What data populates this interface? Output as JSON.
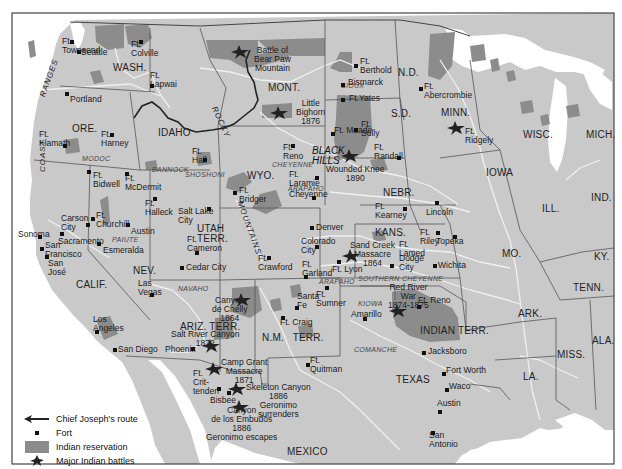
{
  "map": {
    "colors": {
      "land": "#c9c9c9",
      "reservation": "#8c8c8c",
      "water": "#ffffff",
      "border": "#555555",
      "river": "#efefef",
      "route": "#222222",
      "frame": "#444444"
    },
    "states": [
      {
        "id": "wash",
        "label": "WASH.",
        "x": 113,
        "y": 63
      },
      {
        "id": "ore",
        "label": "ORE.",
        "x": 72,
        "y": 124
      },
      {
        "id": "idaho",
        "label": "IDAHO",
        "x": 158,
        "y": 128
      },
      {
        "id": "mont",
        "label": "MONT.",
        "x": 268,
        "y": 83
      },
      {
        "id": "nd",
        "label": "N.D.",
        "x": 398,
        "y": 68
      },
      {
        "id": "sd",
        "label": "S.D.",
        "x": 391,
        "y": 109
      },
      {
        "id": "minn",
        "label": "MINN.",
        "x": 441,
        "y": 108
      },
      {
        "id": "wisc",
        "label": "WISC.",
        "x": 523,
        "y": 130
      },
      {
        "id": "mich",
        "label": "MICH.",
        "x": 586,
        "y": 130
      },
      {
        "id": "wyo",
        "label": "WYO.",
        "x": 247,
        "y": 171
      },
      {
        "id": "nebr",
        "label": "NEBR.",
        "x": 383,
        "y": 188
      },
      {
        "id": "iowa",
        "label": "IOWA",
        "x": 486,
        "y": 168
      },
      {
        "id": "ill",
        "label": "ILL.",
        "x": 542,
        "y": 204
      },
      {
        "id": "ind",
        "label": "IND.",
        "x": 591,
        "y": 193
      },
      {
        "id": "nev",
        "label": "NEV.",
        "x": 133,
        "y": 266
      },
      {
        "id": "calif",
        "label": "CALIF.",
        "x": 76,
        "y": 280
      },
      {
        "id": "utah",
        "label": "UTAH\nTERR.",
        "x": 197,
        "y": 224
      },
      {
        "id": "kans",
        "label": "KANS.",
        "x": 375,
        "y": 228
      },
      {
        "id": "mo",
        "label": "MO.",
        "x": 502,
        "y": 249
      },
      {
        "id": "ky",
        "label": "KY.",
        "x": 594,
        "y": 252
      },
      {
        "id": "tenn",
        "label": "TENN.",
        "x": 573,
        "y": 283
      },
      {
        "id": "ark",
        "label": "ARK.",
        "x": 518,
        "y": 309
      },
      {
        "id": "ala",
        "label": "ALA.",
        "x": 592,
        "y": 336
      },
      {
        "id": "miss",
        "label": "MISS.",
        "x": 557,
        "y": 350
      },
      {
        "id": "la",
        "label": "LA.",
        "x": 523,
        "y": 372
      },
      {
        "id": "ariz",
        "label": "ARIZ. TERR.",
        "x": 180,
        "y": 322
      },
      {
        "id": "nm",
        "label": "N.M.   TERR.",
        "x": 262,
        "y": 333
      },
      {
        "id": "indian",
        "label": "INDIAN TERR.",
        "x": 420,
        "y": 326
      },
      {
        "id": "texas",
        "label": "TEXAS",
        "x": 396,
        "y": 375
      },
      {
        "id": "mexico",
        "label": "MEXICO",
        "x": 287,
        "y": 447
      }
    ],
    "tribes": [
      {
        "label": "SIOUX",
        "x": 341,
        "y": 81
      },
      {
        "label": "MODOC",
        "x": 82,
        "y": 154
      },
      {
        "label": "BANNOCK",
        "x": 152,
        "y": 165
      },
      {
        "label": "SHOSHONI",
        "x": 185,
        "y": 170
      },
      {
        "label": "CHEYENNE",
        "x": 272,
        "y": 160
      },
      {
        "label": "ARAPAHO",
        "x": 288,
        "y": 184
      },
      {
        "label": "PAIUTE",
        "x": 112,
        "y": 235
      },
      {
        "label": "NAVAHO",
        "x": 178,
        "y": 284
      },
      {
        "label": "ARAPAHO",
        "x": 319,
        "y": 277
      },
      {
        "label": "SOUTHERN CHEYENNE",
        "x": 358,
        "y": 274
      },
      {
        "label": "KIOWA",
        "x": 358,
        "y": 299
      },
      {
        "label": "COMANCHE",
        "x": 354,
        "y": 345
      }
    ],
    "mountains": [
      {
        "label": "RANGES",
        "x": 38,
        "y": 95,
        "rot": -70
      },
      {
        "label": "COAST",
        "x": 38,
        "y": 172,
        "rot": -90
      },
      {
        "label": "ROCKY",
        "x": 218,
        "y": 105,
        "rot": 65
      },
      {
        "label": "MOUNTAINS",
        "x": 244,
        "y": 200,
        "rot": 70
      }
    ],
    "regions": [
      {
        "label": "BLACK\nHILLS",
        "x": 312,
        "y": 146
      }
    ],
    "places": [
      {
        "label": "Ft.\nTownsend",
        "x": 62,
        "y": 37,
        "dx": 72,
        "dy": 42
      },
      {
        "label": "Seattle",
        "x": 81,
        "y": 48,
        "dx": 79,
        "dy": 52
      },
      {
        "label": "Ft.\nColville",
        "x": 131,
        "y": 40,
        "dx": 141,
        "dy": 42
      },
      {
        "label": "Ft.\nLapwai",
        "x": 150,
        "y": 71,
        "dx": 152,
        "dy": 86
      },
      {
        "label": "Portland",
        "x": 70,
        "y": 95,
        "dx": 67,
        "dy": 94
      },
      {
        "label": "Ft.\nKlamath",
        "x": 39,
        "y": 130,
        "dx": 65,
        "dy": 146
      },
      {
        "label": "Ft.\nHarney",
        "x": 101,
        "y": 130,
        "dx": 112,
        "dy": 135
      },
      {
        "label": "Ft.\nBerthold",
        "x": 360,
        "y": 57,
        "dx": 356,
        "dy": 66
      },
      {
        "label": "Bismarck",
        "x": 348,
        "y": 78,
        "dx": 343,
        "dy": 85
      },
      {
        "label": "Ft.Yates",
        "x": 349,
        "y": 94,
        "dx": 343,
        "dy": 100
      },
      {
        "label": "Ft.\nAbercrombie",
        "x": 424,
        "y": 82,
        "dx": 421,
        "dy": 89
      },
      {
        "label": "Ft. Meade",
        "x": 334,
        "y": 126,
        "dx": 333,
        "dy": 134
      },
      {
        "label": "Ft.\nSully",
        "x": 361,
        "y": 120,
        "dx": 356,
        "dy": 130
      },
      {
        "label": "Ft.\nRandall",
        "x": 374,
        "y": 143,
        "dx": 399,
        "dy": 158
      },
      {
        "label": "Ft.\nRidgely",
        "x": 465,
        "y": 127,
        "dx": 0,
        "dy": 0
      },
      {
        "label": "Ft.\nHall",
        "x": 192,
        "y": 147,
        "dx": 205,
        "dy": 160
      },
      {
        "label": "Ft.\nBidwell",
        "x": 93,
        "y": 171,
        "dx": 89,
        "dy": 172
      },
      {
        "label": "Ft.\nMcDermit",
        "x": 125,
        "y": 174,
        "dx": 127,
        "dy": 174
      },
      {
        "label": "Ft.\nHalleck",
        "x": 145,
        "y": 199,
        "dx": 155,
        "dy": 199
      },
      {
        "label": "Ft.\nReno",
        "x": 283,
        "y": 143,
        "dx": 293,
        "dy": 146
      },
      {
        "label": "Ft.\nLaramie",
        "x": 289,
        "y": 170,
        "dx": 317,
        "dy": 178
      },
      {
        "label": "Cheyenne",
        "x": 289,
        "y": 190,
        "dx": 314,
        "dy": 198
      },
      {
        "label": "Ft.\nBridger",
        "x": 239,
        "y": 186,
        "dx": 235,
        "dy": 193
      },
      {
        "label": "Salt Lake\nCity",
        "x": 178,
        "y": 207,
        "dx": 209,
        "dy": 209
      },
      {
        "label": "Ft.\nCameron",
        "x": 187,
        "y": 235,
        "dx": 197,
        "dy": 253
      },
      {
        "label": "Cedar City",
        "x": 186,
        "y": 263,
        "dx": 182,
        "dy": 268
      },
      {
        "label": "Carson\nCity",
        "x": 61,
        "y": 214,
        "dx": 88,
        "dy": 225
      },
      {
        "label": "Ft.\nChurchill",
        "x": 96,
        "y": 211,
        "dx": 93,
        "dy": 219
      },
      {
        "label": "Austin",
        "x": 131,
        "y": 227,
        "dx": 128,
        "dy": 225
      },
      {
        "label": "Sacramento",
        "x": 58,
        "y": 237,
        "dx": 62,
        "dy": 234
      },
      {
        "label": "Esmeralda",
        "x": 103,
        "y": 246,
        "dx": 99,
        "dy": 244
      },
      {
        "label": "Sonoma",
        "x": 18,
        "y": 230,
        "dx": 40,
        "dy": 237
      },
      {
        "label": "San\nFrancisco",
        "x": 45,
        "y": 241,
        "dx": 42,
        "dy": 249
      },
      {
        "label": "San\nJosé",
        "x": 48,
        "y": 259,
        "dx": 47,
        "dy": 257
      },
      {
        "label": "Las\nVegas",
        "x": 138,
        "y": 279,
        "dx": 152,
        "dy": 295
      },
      {
        "label": "Denver",
        "x": 316,
        "y": 223,
        "dx": 312,
        "dy": 228
      },
      {
        "label": "Colorado\nCity",
        "x": 301,
        "y": 237,
        "dx": 317,
        "dy": 247
      },
      {
        "label": "Ft.\nCrawford",
        "x": 258,
        "y": 254,
        "dx": 269,
        "dy": 258
      },
      {
        "label": "Ft.\nGarland",
        "x": 302,
        "y": 260,
        "dx": 306,
        "dy": 277
      },
      {
        "label": "Ft. Lyon",
        "x": 332,
        "y": 265,
        "dx": 339,
        "dy": 262
      },
      {
        "label": "Ft.\nKearney",
        "x": 375,
        "y": 202,
        "dx": 405,
        "dy": 209
      },
      {
        "label": "Lincoln",
        "x": 426,
        "y": 208,
        "dx": 437,
        "dy": 203
      },
      {
        "label": "Ft.\nLamed",
        "x": 399,
        "y": 240,
        "dx": 0,
        "dy": 0
      },
      {
        "label": "Dodge\nCity",
        "x": 399,
        "y": 254,
        "dx": 392,
        "dy": 266
      },
      {
        "label": "Ft.\nRiley",
        "x": 420,
        "y": 228,
        "dx": 438,
        "dy": 233
      },
      {
        "label": "Topeka",
        "x": 436,
        "y": 237,
        "dx": 455,
        "dy": 237
      },
      {
        "label": "Wichita",
        "x": 438,
        "y": 261,
        "dx": 435,
        "dy": 266
      },
      {
        "label": "Ft. Reno",
        "x": 418,
        "y": 296,
        "dx": 419,
        "dy": 307
      },
      {
        "label": "Amarillo",
        "x": 351,
        "y": 310,
        "dx": 365,
        "dy": 319
      },
      {
        "label": "Jacksboro",
        "x": 428,
        "y": 347,
        "dx": 424,
        "dy": 353
      },
      {
        "label": "Fort Worth",
        "x": 446,
        "y": 366,
        "dx": 444,
        "dy": 374
      },
      {
        "label": "Waco",
        "x": 449,
        "y": 382,
        "dx": 447,
        "dy": 390
      },
      {
        "label": "Austin",
        "x": 437,
        "y": 399,
        "dx": 440,
        "dy": 412
      },
      {
        "label": "San\nAntonio",
        "x": 429,
        "y": 431,
        "dx": 433,
        "dy": 433
      },
      {
        "label": "Santa\nFe",
        "x": 297,
        "y": 292,
        "dx": 297,
        "dy": 308
      },
      {
        "label": "Ft.\nSumner",
        "x": 316,
        "y": 290,
        "dx": 327,
        "dy": 288
      },
      {
        "label": "Ft. Craig",
        "x": 280,
        "y": 318,
        "dx": 283,
        "dy": 318
      },
      {
        "label": "Ft.\nQuitman",
        "x": 310,
        "y": 356,
        "dx": 308,
        "dy": 365
      },
      {
        "label": "Los\nAngeles",
        "x": 93,
        "y": 315,
        "dx": 97,
        "dy": 332
      },
      {
        "label": "San Diego",
        "x": 118,
        "y": 345,
        "dx": 115,
        "dy": 350
      },
      {
        "label": "Phoenix",
        "x": 165,
        "y": 345,
        "dx": 193,
        "dy": 349
      },
      {
        "label": "Ft.\nCrit-\ntenden",
        "x": 193,
        "y": 369,
        "dx": 219,
        "dy": 389
      },
      {
        "label": "Bisbee",
        "x": 210,
        "y": 396,
        "dx": 229,
        "dy": 393
      }
    ],
    "battles": [
      {
        "label": "Battle of\nBear Paw\nMountain",
        "x": 254,
        "y": 46,
        "sx": 240,
        "sy": 52
      },
      {
        "label": "Little\nBighorn\n1876",
        "x": 296,
        "y": 99,
        "sx": 279,
        "sy": 113
      },
      {
        "label": "Wounded Knee\n1890",
        "x": 326,
        "y": 165,
        "sx": 350,
        "sy": 156
      },
      {
        "label": "Sand Creek\nMassacre\n1864",
        "x": 350,
        "y": 241,
        "sx": 351,
        "sy": 256
      },
      {
        "label": "Red River\nWar\n1874-1875",
        "x": 388,
        "y": 283,
        "sx": 398,
        "sy": 311
      },
      {
        "label": "Canyon\nde Chelly\n1864",
        "x": 212,
        "y": 296,
        "sx": 242,
        "sy": 300
      },
      {
        "label": "Salt River Canyon\n1872",
        "x": 171,
        "y": 330,
        "sx": 211,
        "sy": 346
      },
      {
        "label": "Camp Grant\nMassacre\n1871",
        "x": 221,
        "y": 358,
        "sx": 214,
        "sy": 369
      },
      {
        "label": "Skeleton Canyon\n1886\nGeronimo\nsurrenders",
        "x": 246,
        "y": 383,
        "sx": 237,
        "sy": 389
      },
      {
        "label": "Canyon\nde los Embudos\n1886\nGeronimo escapes",
        "x": 206,
        "y": 406,
        "sx": 240,
        "sy": 407
      },
      {
        "label": "",
        "x": 0,
        "y": 0,
        "sx": 456,
        "sy": 128
      }
    ],
    "legend": {
      "items": [
        {
          "symbol": "arrow-route",
          "label": "Chief Joseph's route"
        },
        {
          "symbol": "fort-dot",
          "label": "Fort"
        },
        {
          "symbol": "reservation-swatch",
          "label": "Indian reservation"
        },
        {
          "symbol": "battle-star",
          "label": "Major Indian battles"
        }
      ]
    }
  }
}
